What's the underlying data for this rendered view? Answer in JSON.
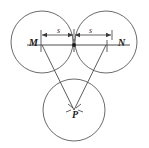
{
  "figure": {
    "type": "geometry-diagram",
    "width": 149,
    "height": 148,
    "background_color": "#ffffff",
    "stroke_color": "#555555",
    "text_color": "#1a1a1a",
    "labels": {
      "M": "M",
      "N": "N",
      "P": "P",
      "s_left": "s",
      "s_right": "s"
    },
    "circles": [
      {
        "name": "top-left-circle",
        "cx": 42,
        "cy": 42,
        "r": 31
      },
      {
        "name": "top-right-circle",
        "cx": 106,
        "cy": 42,
        "r": 31
      },
      {
        "name": "bottom-circle",
        "cx": 74,
        "cy": 110,
        "r": 31
      }
    ],
    "points": [
      {
        "name": "M",
        "x": 42,
        "y": 45
      },
      {
        "name": "N",
        "x": 106,
        "y": 45
      },
      {
        "name": "P",
        "x": 74,
        "y": 110
      },
      {
        "name": "midpoint",
        "x": 74,
        "y": 45
      }
    ],
    "segments": [
      {
        "name": "axis-line",
        "x1": 27,
        "y1": 45,
        "x2": 130,
        "y2": 45
      },
      {
        "name": "leg-M-to-P",
        "x1": 42,
        "y1": 45,
        "x2": 74,
        "y2": 110
      },
      {
        "name": "leg-N-to-P",
        "x1": 106,
        "y1": 45,
        "x2": 74,
        "y2": 110
      }
    ],
    "dimension": {
      "name": "span-s-s",
      "y": 35,
      "x_start": 41,
      "x_mid": 74,
      "x_end": 112,
      "left_value": "s",
      "right_value": "s"
    }
  }
}
